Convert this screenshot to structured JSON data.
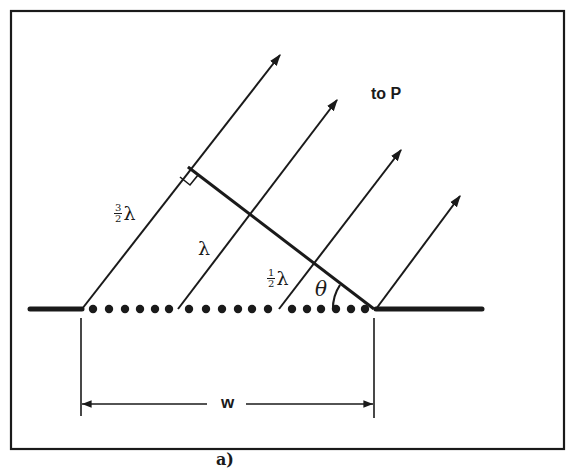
{
  "figure": {
    "colors": {
      "ink": "#1a1a1a",
      "background": "#ffffff"
    },
    "labels": {
      "to_p": "to P",
      "width": "w",
      "theta": "θ",
      "lambda": "λ",
      "three_halves_num": "3",
      "three_halves_den": "2",
      "one_half_num": "1",
      "one_half_den": "2",
      "caption_fragment": "a)"
    },
    "slit": {
      "wall_left": [
        30,
        82
      ],
      "wall_right": [
        376,
        482
      ],
      "y": 309,
      "dot_groups": [
        [
          93,
          109,
          125,
          140,
          155,
          169
        ],
        [
          189,
          206,
          222,
          238,
          252,
          268
        ],
        [
          292,
          307,
          321,
          336,
          351,
          365
        ]
      ]
    },
    "rays": [
      {
        "from": [
          82,
          309
        ],
        "to": [
          280,
          55
        ]
      },
      {
        "from": [
          178,
          309
        ],
        "to": [
          337,
          100
        ]
      },
      {
        "from": [
          279,
          309
        ],
        "to": [
          401,
          150
        ]
      },
      {
        "from": [
          376,
          309
        ],
        "to": [
          460,
          196
        ]
      }
    ],
    "path_difference_line": {
      "from": [
        188,
        167
      ],
      "to": [
        374,
        309
      ]
    }
  }
}
